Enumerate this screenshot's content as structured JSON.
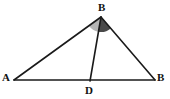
{
  "figure": {
    "background_color": "#ffffff",
    "width": 170,
    "height": 99,
    "stroke_color": "#1a1a1a"
  },
  "labels": {
    "apex": "B",
    "left": "A",
    "right": "B",
    "foot": "D"
  },
  "chart_data": {
    "type": "diagram",
    "points": [
      {
        "name": "A",
        "label": "A",
        "x": 14,
        "y": 80
      },
      {
        "name": "B_apex",
        "label": "B",
        "x": 101,
        "y": 17
      },
      {
        "name": "B_right",
        "label": "B",
        "x": 155,
        "y": 80
      },
      {
        "name": "D",
        "label": "D",
        "x": 90,
        "y": 81
      }
    ],
    "segments": [
      {
        "name": "side-AB-left",
        "from": "A",
        "to": "B_apex",
        "color": "#1a1a1a",
        "width": 1.6
      },
      {
        "name": "side-BB-right",
        "from": "B_apex",
        "to": "B_right",
        "color": "#1a1a1a",
        "width": 1.6
      },
      {
        "name": "base-AB",
        "from": "A",
        "to": "B_right",
        "color": "#1a1a1a",
        "width": 1.6
      },
      {
        "name": "cevian-BD",
        "from": "B_apex",
        "to": "D",
        "color": "#1a1a1a",
        "width": 1.6
      }
    ],
    "angle_sectors": [
      {
        "name": "angle-ABD",
        "vertex": "B_apex",
        "ray_start": "A",
        "ray_end": "D",
        "fill": "#b5b5b5",
        "radius": 15
      },
      {
        "name": "angle-DBB",
        "vertex": "B_apex",
        "ray_start": "D",
        "ray_end": "B_right",
        "fill": "#4a4a4a",
        "radius": 15
      }
    ]
  }
}
